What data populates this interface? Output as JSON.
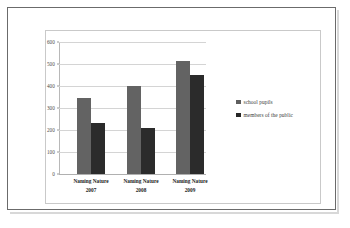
{
  "chart_data": {
    "type": "bar",
    "title": "",
    "subtitle": "",
    "xlabel": "",
    "ylabel": "",
    "categories": [
      "Naming Nature\n2007",
      "Naming Nature\n2008",
      "Naming Nature\n2009"
    ],
    "category_names": [
      "Naming Nature",
      "Naming Nature",
      "Naming Nature"
    ],
    "category_years": [
      "2007",
      "2008",
      "2009"
    ],
    "series": [
      {
        "name": "school pupils",
        "color": "#636363",
        "values": [
          347,
          398,
          513
        ]
      },
      {
        "name": "members of the public",
        "color": "#2b2b2b",
        "values": [
          230,
          208,
          450
        ]
      }
    ],
    "ylim": [
      0,
      600
    ],
    "ytick_labels": [
      "600",
      "500",
      "400",
      "300",
      "200",
      "100",
      "0"
    ],
    "ytick_values": [
      600,
      500,
      400,
      300,
      200,
      100,
      0
    ],
    "grid": true,
    "legend_position": "right",
    "legend_entries": [
      "school pupils",
      "members of the public"
    ]
  },
  "colors": {
    "series_school_pupils": "#636363",
    "series_members_public": "#2b2b2b",
    "gridline": "#d4d4d4",
    "outer_border": "#6b6b6b",
    "inner_border": "#c9c9c9",
    "background": "#ffffff"
  }
}
